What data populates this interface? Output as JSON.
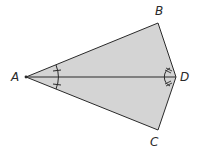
{
  "diagram": {
    "type": "kite",
    "fill_color": "#d4d4d4",
    "stroke_color": "#2a2a2a",
    "vertices": {
      "A": {
        "label": "A",
        "x": 26,
        "y": 77
      },
      "B": {
        "label": "B",
        "x": 158,
        "y": 23
      },
      "C": {
        "label": "C",
        "x": 158,
        "y": 130
      },
      "D": {
        "label": "D",
        "x": 176,
        "y": 77
      }
    },
    "diagonal": "AD",
    "angle_marks": [
      {
        "vertex": "A",
        "style": "single-tick",
        "note": "angle BAD = angle DAC"
      },
      {
        "vertex": "D",
        "style": "double-tick",
        "note": "angle BDA = angle ADC"
      }
    ]
  }
}
